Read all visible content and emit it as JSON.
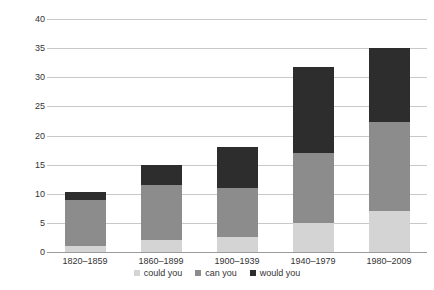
{
  "chart_data": {
    "type": "bar",
    "stacked": true,
    "title": "",
    "xlabel": "",
    "ylabel": "",
    "ylim": [
      0,
      40
    ],
    "ytick_step": 5,
    "yticks": [
      40,
      35,
      30,
      25,
      20,
      15,
      10,
      5,
      0
    ],
    "grid": true,
    "legend_position": "bottom-center",
    "categories": [
      "1820–1859",
      "1860–1899",
      "1900–1939",
      "1940–1979",
      "1980–2009"
    ],
    "series": [
      {
        "name": "could you",
        "color": "#d4d4d4",
        "values": [
          1.0,
          2.1,
          2.5,
          5.0,
          7.0
        ]
      },
      {
        "name": "can you",
        "color": "#8c8c8c",
        "values": [
          8.0,
          9.4,
          8.5,
          12.0,
          15.3
        ]
      },
      {
        "name": "would you",
        "color": "#2d2d2d",
        "values": [
          1.3,
          3.5,
          7.0,
          14.8,
          12.7
        ]
      }
    ],
    "totals": [
      10.3,
      15.0,
      18.0,
      31.8,
      35.0
    ]
  },
  "legend": {
    "items": [
      {
        "label": "could you"
      },
      {
        "label": "can you"
      },
      {
        "label": "would you"
      }
    ]
  }
}
